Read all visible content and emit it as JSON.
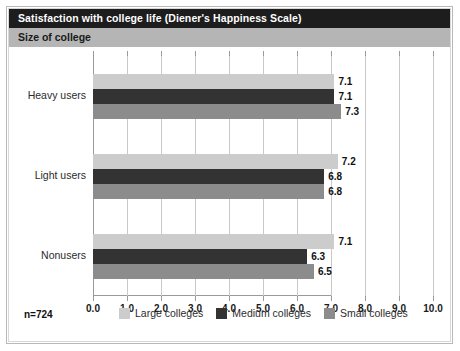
{
  "header": {
    "title": "Satisfaction with college life (Diener's Happiness Scale)",
    "subtitle": "Size of college"
  },
  "footer": {
    "sample_size": "n=724"
  },
  "colors": {
    "title_bar": "#1d1d1d",
    "subtitle_bar": "#b5b5b5",
    "large_colleges": "#cccccc",
    "medium_colleges": "#333333",
    "small_colleges": "#8c8c8c",
    "gridline": "#c9c9c9",
    "axis": "#9a9a9a",
    "frame": "#b9b9b9"
  },
  "chart_data": {
    "type": "bar",
    "orientation": "horizontal",
    "title": "Satisfaction with college life (Diener's Happiness Scale)",
    "subtitle": "Size of college",
    "xlabel": "",
    "ylabel": "",
    "xlim": [
      0.0,
      10.0
    ],
    "xticks": [
      "0.0",
      "1.0",
      "2.0",
      "3.0",
      "4.0",
      "5.0",
      "6.0",
      "7.0",
      "8.0",
      "9.0",
      "10.0"
    ],
    "xtick_values": [
      0,
      1,
      2,
      3,
      4,
      5,
      6,
      7,
      8,
      9,
      10
    ],
    "grid": true,
    "legend_position": "bottom",
    "categories": [
      "Heavy users",
      "Light users",
      "Nonusers"
    ],
    "series": [
      {
        "name": "Large colleges",
        "color": "#cccccc",
        "values": [
          7.1,
          7.2,
          7.1
        ],
        "labels": [
          "7.1",
          "7.2",
          "7.1"
        ]
      },
      {
        "name": "Medium colleges",
        "color": "#333333",
        "values": [
          7.1,
          6.8,
          6.3
        ],
        "labels": [
          "7.1",
          "6.8",
          "6.3"
        ]
      },
      {
        "name": "Small colleges",
        "color": "#8c8c8c",
        "values": [
          7.3,
          6.8,
          6.5
        ],
        "labels": [
          "7.3",
          "6.8",
          "6.5"
        ]
      }
    ],
    "annotations": [
      "n=724"
    ]
  }
}
